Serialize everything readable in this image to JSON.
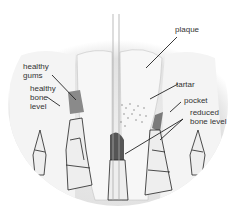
{
  "diagram": {
    "title": "",
    "labels": {
      "healthy_gums": "healthy\ngums",
      "healthy_bone_level": "healthy\nbone\nlevel",
      "plaque": "plaque",
      "tartar": "tartar",
      "pocket": "pocket",
      "reduced_bone_level": "reduced\nbone level"
    },
    "sides": [
      "healthy",
      "diseased"
    ],
    "colors": {
      "tooth": "#f2f2f2",
      "background": "#e6e6e6",
      "gum_healthy": "#8c8c8c",
      "bone_outline": "#222222",
      "text": "#333333"
    }
  }
}
